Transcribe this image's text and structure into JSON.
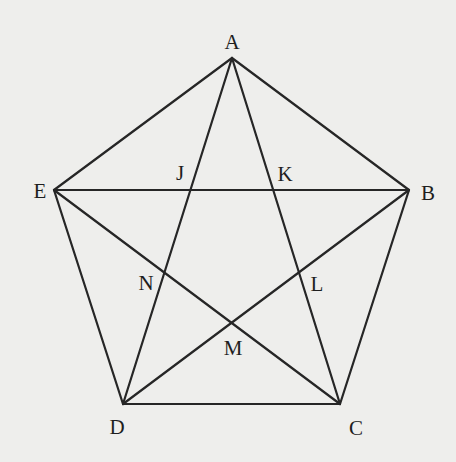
{
  "figure": {
    "colors": {
      "background": "#eeeeec",
      "line": "#262626",
      "text": "#1e1e1e"
    },
    "vertices": [
      {
        "id": "A",
        "x": 232,
        "y": 58
      },
      {
        "id": "B",
        "x": 409,
        "y": 190
      },
      {
        "id": "C",
        "x": 340,
        "y": 404
      },
      {
        "id": "D",
        "x": 123,
        "y": 404
      },
      {
        "id": "E",
        "x": 54,
        "y": 190
      }
    ],
    "edges": [
      {
        "from": "A",
        "to": "B",
        "kind": "side"
      },
      {
        "from": "B",
        "to": "C",
        "kind": "side"
      },
      {
        "from": "C",
        "to": "D",
        "kind": "side"
      },
      {
        "from": "D",
        "to": "E",
        "kind": "side"
      },
      {
        "from": "E",
        "to": "A",
        "kind": "side"
      },
      {
        "from": "A",
        "to": "C",
        "kind": "diagonal"
      },
      {
        "from": "A",
        "to": "D",
        "kind": "diagonal"
      },
      {
        "from": "B",
        "to": "D",
        "kind": "diagonal"
      },
      {
        "from": "B",
        "to": "E",
        "kind": "diagonal"
      },
      {
        "from": "C",
        "to": "E",
        "kind": "diagonal"
      }
    ],
    "labels": [
      {
        "text": "A",
        "x": 232,
        "y": 42
      },
      {
        "text": "B",
        "x": 428,
        "y": 193
      },
      {
        "text": "C",
        "x": 356,
        "y": 428
      },
      {
        "text": "D",
        "x": 117,
        "y": 427
      },
      {
        "text": "E",
        "x": 40,
        "y": 191
      },
      {
        "text": "J",
        "x": 180,
        "y": 173
      },
      {
        "text": "K",
        "x": 285,
        "y": 174
      },
      {
        "text": "L",
        "x": 317,
        "y": 284
      },
      {
        "text": "M",
        "x": 233,
        "y": 348
      },
      {
        "text": "N",
        "x": 146,
        "y": 283
      }
    ],
    "intersection_points": [
      {
        "id": "J",
        "of": [
          "AD",
          "BE"
        ]
      },
      {
        "id": "K",
        "of": [
          "AC",
          "BE"
        ]
      },
      {
        "id": "L",
        "of": [
          "AC",
          "BD"
        ]
      },
      {
        "id": "M",
        "of": [
          "BD",
          "CE"
        ]
      },
      {
        "id": "N",
        "of": [
          "AD",
          "CE"
        ]
      }
    ]
  }
}
